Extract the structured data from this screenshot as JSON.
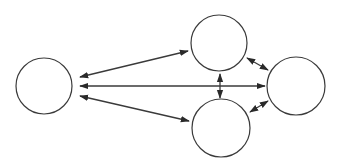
{
  "diagram": {
    "type": "network",
    "stroke_color": "#3a3a3a",
    "background": "#ffffff",
    "nodes": [
      {
        "id": "left",
        "cx": 44,
        "cy": 86,
        "r": 28,
        "label": ""
      },
      {
        "id": "top",
        "cx": 219,
        "cy": 43,
        "r": 28,
        "label": ""
      },
      {
        "id": "bottom",
        "cx": 221,
        "cy": 128,
        "r": 29,
        "label": ""
      },
      {
        "id": "right",
        "cx": 296,
        "cy": 86,
        "r": 29,
        "label": ""
      }
    ],
    "edges": [
      {
        "from": "top",
        "to": "left",
        "x1": 188,
        "y1": 51,
        "x2": 80,
        "y2": 77,
        "start_arrow": true,
        "end_arrow": true
      },
      {
        "from": "right",
        "to": "left",
        "x1": 265,
        "y1": 86,
        "x2": 80,
        "y2": 86,
        "start_arrow": true,
        "end_arrow": true
      },
      {
        "from": "bottom",
        "to": "left",
        "x1": 189,
        "y1": 121,
        "x2": 80,
        "y2": 96,
        "start_arrow": true,
        "end_arrow": true
      },
      {
        "from": "top",
        "to": "bottom",
        "x1": 220,
        "y1": 74,
        "x2": 220,
        "y2": 98,
        "start_arrow": true,
        "end_arrow": true
      },
      {
        "from": "top",
        "to": "right",
        "x1": 247,
        "y1": 58,
        "x2": 268,
        "y2": 70,
        "start_arrow": true,
        "end_arrow": true
      },
      {
        "from": "bottom",
        "to": "right",
        "x1": 250,
        "y1": 112,
        "x2": 268,
        "y2": 101,
        "start_arrow": true,
        "end_arrow": true
      }
    ]
  }
}
